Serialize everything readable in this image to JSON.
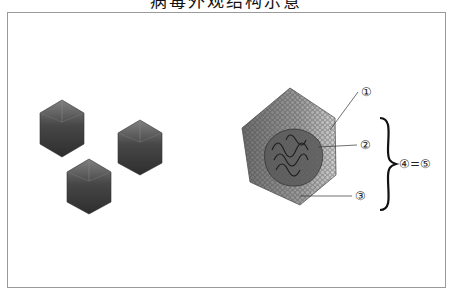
{
  "title": "病毒外观结构示意",
  "figure": {
    "left_panel": {
      "description": "three icosahedral virus particles",
      "particle_count": 3
    },
    "right_panel": {
      "description": "cutaway view of icosahedral virus with labeled parts",
      "labels": {
        "l1": "①",
        "l2": "②",
        "l3": "③",
        "equation": "④=⑤"
      }
    },
    "colors": {
      "frame": "#9a9a9a",
      "particle_dark": "#3a3a3a",
      "particle_mid": "#6b6b6b",
      "capsid_light": "#b8b8b8"
    }
  }
}
